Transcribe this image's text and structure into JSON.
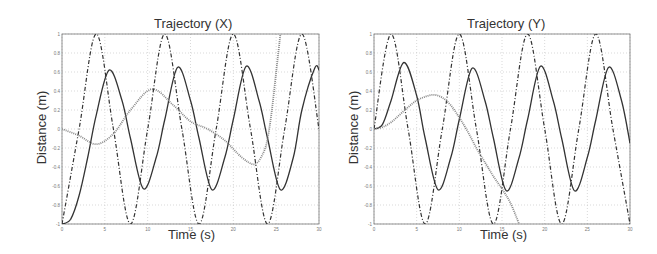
{
  "chart_data": [
    {
      "type": "line",
      "title": "Trajectory (X)",
      "xlabel": "Time (s)",
      "ylabel": "Distance (m)",
      "xlim": [
        0,
        30
      ],
      "ylim": [
        -1,
        1
      ],
      "xticks": [
        "0",
        "5",
        "10",
        "15",
        "20",
        "25",
        "30"
      ],
      "yticks": [
        "-1",
        "-0.8",
        "-0.6",
        "-0.4",
        "-0.2",
        "0",
        "0.2",
        "0.4",
        "0.6",
        "0.8",
        "1"
      ],
      "grid": true,
      "legend": null,
      "series": [
        {
          "name": "dash-dot (reference)",
          "style": "dashdot",
          "x": [
            0,
            2,
            4,
            6,
            8,
            10,
            12,
            14,
            16,
            18,
            20,
            22,
            24,
            26,
            28,
            30
          ],
          "y": [
            -1,
            0,
            1,
            0,
            -1,
            0,
            1,
            0,
            -1,
            0,
            1,
            0,
            -1,
            0,
            1,
            0
          ]
        },
        {
          "name": "solid",
          "style": "solid",
          "x": [
            0,
            1,
            2,
            3,
            4,
            5.5,
            7,
            8,
            9.5,
            11,
            12,
            13.5,
            15,
            16,
            17.5,
            19,
            20,
            21.5,
            23,
            24,
            25.5,
            27,
            28,
            29.5,
            30
          ],
          "y": [
            -1,
            -0.95,
            -0.7,
            -0.3,
            0.15,
            0.62,
            0.3,
            -0.1,
            -0.63,
            -0.3,
            0.1,
            0.65,
            0.3,
            -0.1,
            -0.64,
            -0.3,
            0.1,
            0.66,
            0.3,
            -0.1,
            -0.64,
            -0.3,
            0.2,
            0.64,
            0.62
          ]
        },
        {
          "name": "dotted",
          "style": "dotted",
          "x": [
            0,
            2,
            4,
            6,
            8,
            10.5,
            13,
            15,
            17,
            19,
            21,
            22.5,
            23.5,
            24,
            24.5,
            25,
            25.5
          ],
          "y": [
            0,
            -0.07,
            -0.16,
            -0.05,
            0.2,
            0.42,
            0.25,
            0.08,
            0,
            -0.12,
            -0.3,
            -0.37,
            -0.25,
            -0.1,
            0.2,
            0.6,
            1
          ]
        }
      ]
    },
    {
      "type": "line",
      "title": "Trajectory (Y)",
      "xlabel": "Time (s)",
      "ylabel": "Distance (m)",
      "xlim": [
        0,
        30
      ],
      "ylim": [
        -1,
        1
      ],
      "xticks": [
        "0",
        "5",
        "10",
        "15",
        "20",
        "25",
        "30"
      ],
      "yticks": [
        "-1",
        "-0.8",
        "-0.6",
        "-0.4",
        "-0.2",
        "0",
        "0.2",
        "0.4",
        "0.6",
        "0.8",
        "1"
      ],
      "grid": true,
      "legend": null,
      "series": [
        {
          "name": "dash-dot (reference)",
          "style": "dashdot",
          "x": [
            0,
            2,
            4,
            6,
            8,
            10,
            12,
            14,
            16,
            18,
            20,
            22,
            24,
            26,
            28,
            30
          ],
          "y": [
            0,
            1,
            0,
            -1,
            0,
            1,
            0,
            -1,
            0,
            1,
            0,
            -1,
            0,
            1,
            0,
            -1
          ]
        },
        {
          "name": "solid",
          "style": "solid",
          "x": [
            0,
            1,
            2,
            3.5,
            5,
            6,
            7.5,
            9,
            10,
            11.5,
            13,
            14,
            15.5,
            17,
            18,
            19.5,
            21,
            22,
            23.5,
            25,
            26,
            27.5,
            29,
            30
          ],
          "y": [
            0,
            0.05,
            0.3,
            0.7,
            0.35,
            -0.1,
            -0.64,
            -0.3,
            0.1,
            0.64,
            0.3,
            -0.1,
            -0.65,
            -0.3,
            0.1,
            0.66,
            0.3,
            -0.1,
            -0.65,
            -0.3,
            0.1,
            0.65,
            0.3,
            -0.15
          ]
        },
        {
          "name": "dotted",
          "style": "dotted",
          "x": [
            0,
            1,
            2,
            3,
            4,
            5,
            6,
            7,
            8,
            9,
            10,
            11,
            12,
            13,
            14,
            15,
            16,
            17
          ],
          "y": [
            0,
            0.02,
            0.07,
            0.15,
            0.23,
            0.3,
            0.34,
            0.36,
            0.33,
            0.25,
            0.12,
            -0.03,
            -0.2,
            -0.35,
            -0.5,
            -0.63,
            -0.78,
            -1
          ]
        }
      ]
    }
  ],
  "figures": [
    {
      "title": "Trajectory (X)",
      "xlabel": "Time (s)",
      "ylabel": "Distance (m)"
    },
    {
      "title": "Trajectory (Y)",
      "xlabel": "Time (s)",
      "ylabel": "Distance (m)"
    }
  ],
  "colors": {
    "line": "#333333",
    "dotted": "#888888",
    "grid": "#c8c8c8",
    "axis": "#777777",
    "tick_text": "#777777"
  }
}
